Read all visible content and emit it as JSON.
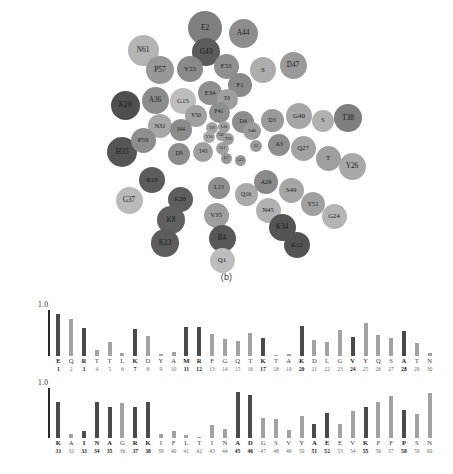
{
  "figure": {
    "panel_b_caption": "(b)",
    "panel_c_caption": "(c)"
  },
  "panel_b": {
    "name": "residue-bubble-map",
    "bubbles": [
      {
        "label": "E2",
        "x": 205,
        "y": 28,
        "d": 34,
        "shade": "#7f7f7f"
      },
      {
        "label": "A44",
        "x": 243,
        "y": 33,
        "d": 29,
        "shade": "#8d8d8d"
      },
      {
        "label": "N61",
        "x": 143,
        "y": 50,
        "d": 31,
        "shade": "#b4b4b4"
      },
      {
        "label": "G43",
        "x": 206,
        "y": 52,
        "d": 28,
        "shade": "#5a5a5a"
      },
      {
        "label": "P57",
        "x": 160,
        "y": 70,
        "d": 28,
        "shade": "#989898"
      },
      {
        "label": "Y55",
        "x": 190,
        "y": 69,
        "d": 26,
        "shade": "#8a8a8a"
      },
      {
        "label": "E53",
        "x": 226,
        "y": 66,
        "d": 25,
        "shade": "#8f8f8f"
      },
      {
        "label": "S",
        "x": 263,
        "y": 70,
        "d": 26,
        "shade": "#adadad"
      },
      {
        "label": "D47",
        "x": 293,
        "y": 65,
        "d": 27,
        "shade": "#9a9a9a"
      },
      {
        "label": "F1",
        "x": 240,
        "y": 85,
        "d": 24,
        "shade": "#8a8a8a"
      },
      {
        "label": "E34",
        "x": 210,
        "y": 93,
        "d": 24,
        "shade": "#8f8f8f"
      },
      {
        "label": "A36",
        "x": 155,
        "y": 100,
        "d": 27,
        "shade": "#8c8c8c"
      },
      {
        "label": "K20",
        "x": 125,
        "y": 105,
        "d": 29,
        "shade": "#4f4f4f"
      },
      {
        "label": "G15",
        "x": 183,
        "y": 101,
        "d": 26,
        "shade": "#bdbdbd"
      },
      {
        "label": "T6",
        "x": 227,
        "y": 99,
        "d": 21,
        "shade": "#9e9e9e"
      },
      {
        "label": "N31",
        "x": 160,
        "y": 126,
        "d": 24,
        "shade": "#a7a7a7"
      },
      {
        "label": "Y50",
        "x": 196,
        "y": 116,
        "d": 22,
        "shade": "#a0a0a0"
      },
      {
        "label": "F41",
        "x": 219,
        "y": 112,
        "d": 21,
        "shade": "#8f8f8f"
      },
      {
        "label": "D4",
        "x": 243,
        "y": 122,
        "d": 22,
        "shade": "#8d8d8d"
      },
      {
        "label": "D3",
        "x": 272,
        "y": 120,
        "d": 23,
        "shade": "#9a9a9a"
      },
      {
        "label": "G40",
        "x": 299,
        "y": 116,
        "d": 26,
        "shade": "#a6a6a6"
      },
      {
        "label": "S",
        "x": 323,
        "y": 121,
        "d": 22,
        "shade": "#b0b0b0"
      },
      {
        "label": "T38",
        "x": 348,
        "y": 118,
        "d": 28,
        "shade": "#7e7e7e"
      },
      {
        "label": "I44",
        "x": 181,
        "y": 130,
        "d": 22,
        "shade": "#8b8b8b"
      },
      {
        "label": "I39",
        "x": 212,
        "y": 128,
        "d": 12,
        "shade": "#a4a4a4"
      },
      {
        "label": "L26",
        "x": 224,
        "y": 127,
        "d": 12,
        "shade": "#a0a0a0"
      },
      {
        "label": "Y10",
        "x": 209,
        "y": 137,
        "d": 12,
        "shade": "#a8a8a8"
      },
      {
        "label": "T42",
        "x": 221,
        "y": 135,
        "d": 11,
        "shade": "#a0a0a0"
      },
      {
        "label": "T19",
        "x": 228,
        "y": 139,
        "d": 12,
        "shade": "#9d9d9d"
      },
      {
        "label": "S40",
        "x": 252,
        "y": 131,
        "d": 18,
        "shade": "#9c9c9c"
      },
      {
        "label": "A3",
        "x": 279,
        "y": 145,
        "d": 22,
        "shade": "#8d8d8d"
      },
      {
        "label": "Q27",
        "x": 303,
        "y": 148,
        "d": 25,
        "shade": "#a3a3a3"
      },
      {
        "label": "H35",
        "x": 122,
        "y": 152,
        "d": 30,
        "shade": "#555555"
      },
      {
        "label": "P59",
        "x": 143,
        "y": 140,
        "d": 25,
        "shade": "#8e8e8e"
      },
      {
        "label": "D9",
        "x": 179,
        "y": 154,
        "d": 22,
        "shade": "#8c8c8c"
      },
      {
        "label": "T43",
        "x": 203,
        "y": 152,
        "d": 20,
        "shade": "#9f9f9f"
      },
      {
        "label": "A11",
        "x": 222,
        "y": 148,
        "d": 13,
        "shade": "#a0a0a0"
      },
      {
        "label": "I5",
        "x": 256,
        "y": 146,
        "d": 12,
        "shade": "#9a9a9a"
      },
      {
        "label": "L7",
        "x": 226,
        "y": 158,
        "d": 11,
        "shade": "#979797"
      },
      {
        "label": "A22",
        "x": 240,
        "y": 160,
        "d": 11,
        "shade": "#9b9b9b"
      },
      {
        "label": "T",
        "x": 328,
        "y": 158,
        "d": 25,
        "shade": "#9f9f9f"
      },
      {
        "label": "Y26",
        "x": 352,
        "y": 166,
        "d": 27,
        "shade": "#a9a9a9"
      },
      {
        "label": "R18",
        "x": 152,
        "y": 180,
        "d": 26,
        "shade": "#5c5c5c"
      },
      {
        "label": "L13",
        "x": 219,
        "y": 188,
        "d": 22,
        "shade": "#8f8f8f"
      },
      {
        "label": "Q16",
        "x": 246,
        "y": 194,
        "d": 23,
        "shade": "#a9a9a9"
      },
      {
        "label": "A29",
        "x": 266,
        "y": 182,
        "d": 24,
        "shade": "#8a8a8a"
      },
      {
        "label": "S49",
        "x": 291,
        "y": 190,
        "d": 25,
        "shade": "#a6a6a6"
      },
      {
        "label": "G37",
        "x": 129,
        "y": 200,
        "d": 27,
        "shade": "#bababa"
      },
      {
        "label": "K28",
        "x": 180,
        "y": 199,
        "d": 25,
        "shade": "#5e5e5e"
      },
      {
        "label": "N45",
        "x": 268,
        "y": 210,
        "d": 25,
        "shade": "#b1b1b1"
      },
      {
        "label": "Y51",
        "x": 313,
        "y": 204,
        "d": 24,
        "shade": "#a0a0a0"
      },
      {
        "label": "G24",
        "x": 334,
        "y": 216,
        "d": 25,
        "shade": "#b4b4b4"
      },
      {
        "label": "V35",
        "x": 216,
        "y": 215,
        "d": 25,
        "shade": "#9e9e9e"
      },
      {
        "label": "K8",
        "x": 171,
        "y": 220,
        "d": 28,
        "shade": "#606060"
      },
      {
        "label": "K34",
        "x": 282,
        "y": 227,
        "d": 27,
        "shade": "#545454"
      },
      {
        "label": "K23",
        "x": 165,
        "y": 243,
        "d": 28,
        "shade": "#5d5d5d"
      },
      {
        "label": "R4",
        "x": 222,
        "y": 238,
        "d": 27,
        "shade": "#585858"
      },
      {
        "label": "K12",
        "x": 297,
        "y": 245,
        "d": 26,
        "shade": "#535353"
      },
      {
        "label": "Q1",
        "x": 222,
        "y": 260,
        "d": 25,
        "shade": "#bdbdbd"
      }
    ]
  },
  "chart_data": [
    {
      "type": "bar",
      "name": "per-residue-values-1-30",
      "title": "",
      "xlabel": "",
      "ylabel": "",
      "ylim": [
        0,
        1.0
      ],
      "y_axis_label": "1.0",
      "grid": false,
      "legend": "none",
      "categories": [
        "1",
        "2",
        "3",
        "4",
        "5",
        "6",
        "7",
        "8",
        "9",
        "10",
        "11",
        "12",
        "13",
        "14",
        "15",
        "16",
        "17",
        "18",
        "19",
        "20",
        "21",
        "22",
        "23",
        "24",
        "25",
        "26",
        "27",
        "28",
        "29",
        "30"
      ],
      "residues": [
        "E",
        "Q",
        "R",
        "T",
        "T",
        "L",
        "K",
        "D",
        "Y",
        "A",
        "M",
        "R",
        "F",
        "G",
        "Q",
        "T",
        "K",
        "T",
        "A",
        "K",
        "D",
        "L",
        "G",
        "V",
        "Y",
        "Q",
        "S",
        "A",
        "T",
        "N"
      ],
      "values": [
        0.92,
        0.8,
        0.61,
        0.12,
        0.3,
        0.06,
        0.58,
        0.44,
        0.05,
        0.08,
        0.63,
        0.63,
        0.48,
        0.38,
        0.32,
        0.5,
        0.4,
        0.02,
        0.04,
        0.66,
        0.34,
        0.3,
        0.56,
        0.42,
        0.72,
        0.46,
        0.4,
        0.54,
        0.28,
        0.06
      ],
      "values_tail": [
        0.34
      ],
      "emphasis": [
        "dark",
        "light",
        "dark",
        "light",
        "light",
        "light",
        "dark",
        "light",
        "light",
        "light",
        "dark",
        "dark",
        "light",
        "light",
        "light",
        "light",
        "dark",
        "light",
        "light",
        "dark",
        "light",
        "light",
        "light",
        "dark",
        "light",
        "light",
        "light",
        "dark",
        "light",
        "light"
      ]
    },
    {
      "type": "bar",
      "name": "per-residue-values-31-60",
      "title": "",
      "xlabel": "",
      "ylabel": "",
      "ylim": [
        0,
        1.0
      ],
      "y_axis_label": "1.0",
      "grid": false,
      "legend": "none",
      "categories": [
        "31",
        "32",
        "33",
        "34",
        "35",
        "36",
        "37",
        "38",
        "39",
        "40",
        "41",
        "42",
        "43",
        "44",
        "45",
        "46",
        "47",
        "48",
        "49",
        "50",
        "51",
        "52",
        "53",
        "54",
        "55",
        "56",
        "57",
        "58",
        "59",
        "60"
      ],
      "residues": [
        "K",
        "A",
        "I",
        "N",
        "A",
        "G",
        "R",
        "K",
        "I",
        "F",
        "L",
        "T",
        "I",
        "N",
        "A",
        "D",
        "G",
        "S",
        "V",
        "Y",
        "A",
        "E",
        "E",
        "V",
        "K",
        "P",
        "F",
        "P",
        "S",
        "N"
      ],
      "values": [
        0.72,
        0.08,
        0.14,
        0.72,
        0.62,
        0.7,
        0.62,
        0.72,
        0.08,
        0.14,
        0.06,
        0.02,
        0.26,
        0.18,
        0.92,
        0.86,
        0.4,
        0.38,
        0.16,
        0.44,
        0.28,
        0.5,
        0.28,
        0.54,
        0.62,
        0.72,
        0.84,
        0.56,
        0.48,
        0.9
      ],
      "emphasis": [
        "dark",
        "light",
        "dark",
        "dark",
        "dark",
        "light",
        "dark",
        "dark",
        "light",
        "light",
        "light",
        "light",
        "light",
        "light",
        "dark",
        "dark",
        "light",
        "light",
        "light",
        "light",
        "dark",
        "dark",
        "light",
        "light",
        "dark",
        "light",
        "light",
        "dark",
        "light",
        "light"
      ]
    }
  ]
}
